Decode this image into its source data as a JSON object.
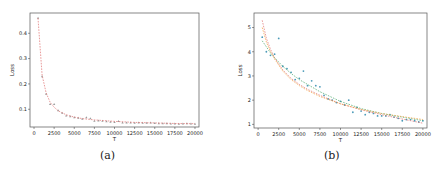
{
  "captions": {
    "a": "(a)",
    "b": "(b)"
  },
  "colors": {
    "background": "#ffffff",
    "frame": "#555555",
    "fit_red": "#e07070",
    "fit_orange": "#f0a040",
    "fit_green": "#4aa86a",
    "points_grey": "#777777",
    "points_blue": "#4a9ab8"
  },
  "chart_data": [
    {
      "type": "line",
      "panel": "(a)",
      "title": "",
      "xlabel": "T",
      "ylabel": "Loss",
      "xlim": [
        -500,
        20500
      ],
      "ylim": [
        0.03,
        0.48
      ],
      "xticks": [
        0,
        2500,
        5000,
        7500,
        10000,
        12500,
        15000,
        17500,
        20000
      ],
      "yticks": [
        0.1,
        0.2,
        0.3,
        0.4
      ],
      "grid": false,
      "legend": null,
      "series": [
        {
          "name": "observed",
          "style": "markers",
          "x": [
            500,
            1000,
            1500,
            2000,
            2500,
            3000,
            3500,
            4000,
            4500,
            5000,
            5500,
            6000,
            6500,
            7000,
            7500,
            8000,
            8500,
            9000,
            9500,
            10000,
            10500,
            11000,
            11500,
            12000,
            12500,
            13000,
            13500,
            14000,
            14500,
            15000,
            15500,
            16000,
            16500,
            17000,
            17500,
            18000,
            18500,
            19000,
            19500,
            20000
          ],
          "y": [
            0.46,
            0.23,
            0.16,
            0.12,
            0.12,
            0.095,
            0.085,
            0.075,
            0.072,
            0.068,
            0.066,
            0.062,
            0.068,
            0.064,
            0.054,
            0.055,
            0.054,
            0.052,
            0.05,
            0.049,
            0.053,
            0.047,
            0.047,
            0.047,
            0.046,
            0.047,
            0.046,
            0.046,
            0.047,
            0.045,
            0.044,
            0.044,
            0.044,
            0.043,
            0.043,
            0.042,
            0.043,
            0.044,
            0.043,
            0.042
          ]
        },
        {
          "name": "fit",
          "style": "dashed",
          "x": [
            500,
            1000,
            1500,
            2000,
            2500,
            3000,
            4000,
            5000,
            6000,
            7500,
            10000,
            12500,
            15000,
            17500,
            20000
          ],
          "y": [
            0.46,
            0.235,
            0.165,
            0.128,
            0.108,
            0.094,
            0.078,
            0.069,
            0.063,
            0.058,
            0.052,
            0.048,
            0.046,
            0.044,
            0.043
          ]
        }
      ]
    },
    {
      "type": "scatter",
      "panel": "(b)",
      "title": "",
      "xlabel": "T",
      "ylabel": "Loss",
      "xlim": [
        -500,
        20500
      ],
      "ylim": [
        0.85,
        5.6
      ],
      "xticks": [
        0,
        2500,
        5000,
        7500,
        10000,
        12500,
        15000,
        17500,
        20000
      ],
      "yticks": [
        1,
        2,
        3,
        4,
        5
      ],
      "grid": false,
      "legend": null,
      "series": [
        {
          "name": "observed",
          "style": "markers",
          "x": [
            500,
            1000,
            1500,
            2000,
            2500,
            3000,
            3500,
            4000,
            4500,
            5000,
            5500,
            6000,
            6500,
            7000,
            7500,
            8000,
            8500,
            9000,
            9500,
            10000,
            10500,
            11000,
            11500,
            12000,
            12500,
            13000,
            13500,
            14000,
            14500,
            15000,
            15500,
            16000,
            16500,
            17000,
            17500,
            18000,
            18500,
            19000,
            19500,
            20000
          ],
          "y": [
            4.6,
            4.0,
            3.85,
            3.9,
            4.55,
            3.4,
            3.3,
            3.15,
            2.85,
            2.9,
            3.2,
            2.6,
            2.8,
            2.6,
            2.55,
            2.2,
            2.05,
            2.0,
            1.9,
            1.95,
            1.8,
            2.0,
            1.5,
            1.7,
            1.55,
            1.4,
            1.5,
            1.45,
            1.35,
            1.35,
            1.35,
            1.4,
            1.3,
            1.25,
            1.15,
            1.2,
            1.2,
            1.15,
            1.1,
            1.15
          ]
        },
        {
          "name": "fit-1",
          "style": "dashed",
          "x": [
            500,
            1000,
            1500,
            2000,
            3000,
            4000,
            5000,
            6000,
            7500,
            10000,
            12500,
            15000,
            17500,
            20000
          ],
          "y": [
            5.3,
            4.55,
            4.1,
            3.75,
            3.25,
            2.9,
            2.65,
            2.45,
            2.2,
            1.85,
            1.6,
            1.4,
            1.22,
            1.05
          ]
        },
        {
          "name": "fit-2",
          "style": "dashed",
          "x": [
            500,
            1000,
            1500,
            2000,
            3000,
            4000,
            5000,
            6000,
            7500,
            10000,
            12500,
            15000,
            17500,
            20000
          ],
          "y": [
            4.45,
            4.2,
            3.95,
            3.75,
            3.4,
            3.1,
            2.85,
            2.65,
            2.35,
            1.95,
            1.65,
            1.45,
            1.3,
            1.15
          ]
        },
        {
          "name": "fit-3",
          "style": "dashed",
          "x": [
            500,
            1000,
            1500,
            2000,
            3000,
            4000,
            5000,
            6000,
            7500,
            10000,
            12500,
            15000,
            17500,
            20000
          ],
          "y": [
            5.0,
            4.4,
            4.0,
            3.7,
            3.2,
            2.85,
            2.6,
            2.4,
            2.15,
            1.85,
            1.62,
            1.45,
            1.32,
            1.2
          ]
        }
      ]
    }
  ]
}
